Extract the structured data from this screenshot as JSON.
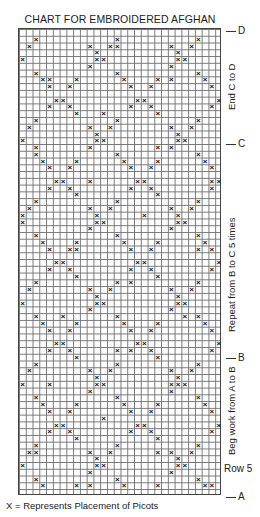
{
  "title": "CHART FOR EMBROIDERED AFGHAN",
  "footer": "X = Represents Placement of Picots",
  "markers": {
    "D": "D",
    "C": "C",
    "B": "B",
    "A": "A"
  },
  "side_labels": {
    "end_c_to_d": "End C to D",
    "repeat_b_to_c": "Repeat from B to C 5 times",
    "beg_a_to_b": "Beg work from A to B",
    "row5": "Row 5"
  },
  "chart_data": {
    "type": "table",
    "title": "CHART FOR EMBROIDERED AFGHAN",
    "grid": {
      "columns": 30,
      "rows": 69,
      "grid_lines": true
    },
    "legend": "X = Represents Placement of Picots",
    "section_markers": [
      {
        "label": "D",
        "row_from_bottom": 69
      },
      {
        "label": "C",
        "row_from_bottom": 52
      },
      {
        "label": "B",
        "row_from_bottom": 20
      },
      {
        "label": "A",
        "row_from_bottom": 0
      }
    ],
    "annotations": [
      "End C to D",
      "Repeat from B to C 5 times",
      "Beg work from A to B",
      "Row 5"
    ],
    "mark_symbol": "×"
  }
}
